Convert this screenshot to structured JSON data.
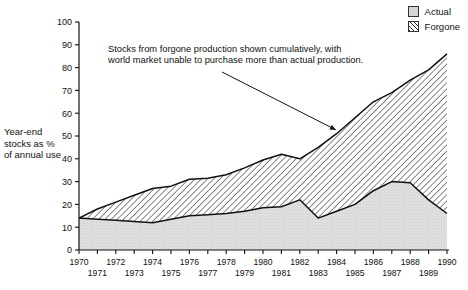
{
  "legend": {
    "position": "top-right",
    "items": [
      {
        "label": "Actual",
        "swatch": "solid-gray",
        "color": "#d6d6d6"
      },
      {
        "label": "Forgone",
        "swatch": "diagonal-hatch",
        "color": "#2b2b2b"
      }
    ]
  },
  "axis": {
    "ylabel_lines": [
      "Year-end",
      "stocks as %",
      "of annual use"
    ],
    "ylabel": "Year-end stocks as % of annual use"
  },
  "annotation": {
    "line1": "Stocks from forgone production shown cumulatively, with",
    "line2": "world market unable to purchase more than actual production.",
    "text": "Stocks from forgone production shown cumulatively, with world market unable to purchase more than actual production.",
    "arrow_target_year": 1984,
    "arrow_target_value": 51
  },
  "chart_data": {
    "type": "area",
    "title": "",
    "xlabel": "",
    "ylabel": "Year-end stocks as % of annual use",
    "xlim": [
      1970,
      1990
    ],
    "ylim": [
      0,
      100
    ],
    "yticks": [
      0,
      10,
      20,
      30,
      40,
      50,
      60,
      70,
      80,
      90,
      100
    ],
    "grid": false,
    "stacked": true,
    "x": [
      1970,
      1971,
      1972,
      1973,
      1974,
      1975,
      1976,
      1977,
      1978,
      1979,
      1980,
      1981,
      1982,
      1983,
      1984,
      1985,
      1986,
      1987,
      1988,
      1989,
      1990
    ],
    "categories": [
      "1970",
      "1971",
      "1972",
      "1973",
      "1974",
      "1975",
      "1976",
      "1977",
      "1978",
      "1979",
      "1980",
      "1981",
      "1982",
      "1983",
      "1984",
      "1985",
      "1986",
      "1987",
      "1988",
      "1989",
      "1990"
    ],
    "xticklabels_upper": [
      "1970",
      "1972",
      "1974",
      "1976",
      "1978",
      "1980",
      "1982",
      "1984",
      "1986",
      "1988",
      "1990"
    ],
    "xticklabels_lower": [
      "1971",
      "1973",
      "1975",
      "1977",
      "1979",
      "1981",
      "1983",
      "1985",
      "1987",
      "1989"
    ],
    "series": [
      {
        "name": "Actual",
        "fill": "solid-gray",
        "values": [
          14,
          13.5,
          13,
          12.5,
          12,
          13.5,
          15,
          15.5,
          16,
          17,
          18.5,
          19,
          22,
          14,
          17,
          20,
          26,
          30,
          29.5,
          22,
          16
        ]
      },
      {
        "name": "Forgone",
        "fill": "diagonal-hatch",
        "values": [
          0,
          4.5,
          8,
          11.5,
          15,
          14.5,
          16,
          16,
          17,
          19,
          21,
          23,
          18,
          31,
          34,
          38,
          39,
          39,
          45,
          57,
          70
        ]
      }
    ],
    "total": {
      "name": "Actual + Forgone",
      "values": [
        14,
        18,
        21,
        24,
        27,
        28,
        31,
        31.5,
        33,
        36,
        39.5,
        42,
        40,
        45,
        51,
        58,
        65,
        69,
        74.5,
        79,
        86
      ]
    }
  }
}
